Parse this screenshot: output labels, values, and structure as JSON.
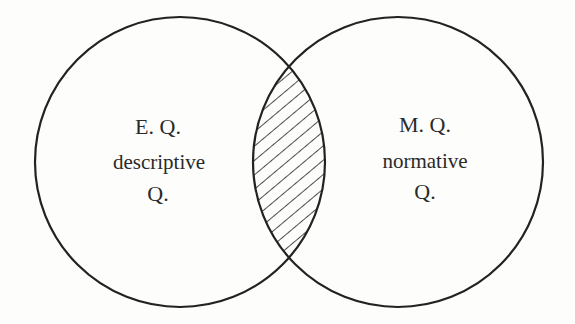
{
  "diagram": {
    "type": "venn",
    "left": {
      "line1": "E. Q.",
      "line2": "descriptive",
      "line3": "Q."
    },
    "right": {
      "line1": "M. Q.",
      "line2": "normative",
      "line3": "Q."
    },
    "intersection": {
      "fill": "hatched"
    },
    "colors": {
      "stroke": "#222222",
      "background": "#fdfdfc"
    }
  }
}
